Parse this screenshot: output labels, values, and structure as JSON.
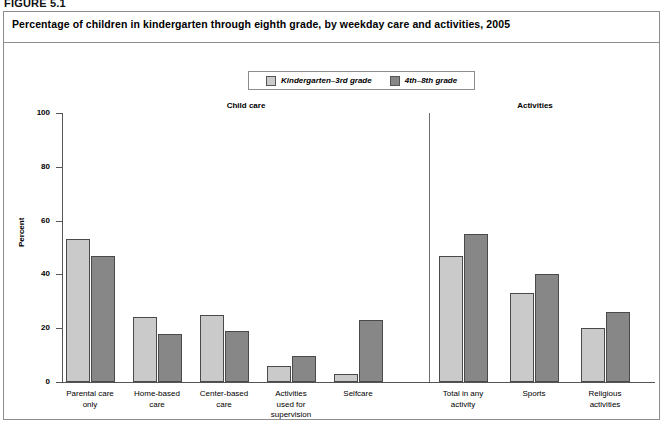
{
  "figure": {
    "label": "FIGURE 5.1",
    "title": "Percentage of children in kindergarten through eighth grade, by weekday care and activities, 2005"
  },
  "legend": {
    "position": "top-center",
    "entries": [
      {
        "label": "Kindergarten–3rd grade",
        "color": "#cacaca"
      },
      {
        "label": "4th–8th grade",
        "color": "#878787"
      }
    ]
  },
  "sections": [
    {
      "name": "Child care",
      "center_x": 246
    },
    {
      "name": "Activities",
      "center_x": 535
    }
  ],
  "colors": {
    "light_gray": "#cacaca",
    "dark_gray": "#878787",
    "bar_outline": "#4a4a4a",
    "axis": "#555555",
    "border": "#8d8d8d",
    "background": "#ffffff"
  },
  "chart_data": {
    "type": "bar",
    "title": "Percentage of children in kindergarten through eighth grade, by weekday care and activities, 2005",
    "xlabel": "",
    "ylabel": "Percent",
    "ylim": [
      0,
      100
    ],
    "yticks": [
      0,
      20,
      40,
      60,
      80,
      100
    ],
    "grid": false,
    "legend_position": "top-center",
    "categories": [
      "Parental care only",
      "Home-based care",
      "Center-based care",
      "Activities used for supervision",
      "Selfcare",
      "Total in any activity",
      "Sports",
      "Religious activities"
    ],
    "category_labels_wrapped": [
      [
        "Parental care",
        "only"
      ],
      [
        "Home-based",
        "care"
      ],
      [
        "Center-based",
        "care"
      ],
      [
        "Activities",
        "used for",
        "supervision"
      ],
      [
        "Selfcare"
      ],
      [
        "Total in any",
        "activity"
      ],
      [
        "Sports"
      ],
      [
        "Religious",
        "activities"
      ]
    ],
    "series": [
      {
        "name": "Kindergarten–3rd grade",
        "color": "#cacaca",
        "values": [
          53,
          24,
          25,
          6,
          3,
          47,
          33,
          20
        ]
      },
      {
        "name": "4th–8th grade",
        "color": "#878787",
        "values": [
          47,
          18,
          19,
          9.5,
          23,
          55,
          40,
          26
        ]
      }
    ],
    "group_sections": [
      "Child care",
      "Child care",
      "Child care",
      "Child care",
      "Child care",
      "Activities",
      "Activities",
      "Activities"
    ],
    "group_centers_px": [
      90,
      157,
      224,
      291,
      358,
      463,
      534,
      605
    ]
  }
}
